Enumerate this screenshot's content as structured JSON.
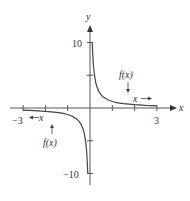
{
  "chart_data": {
    "type": "line",
    "title": "",
    "function": "f(x) = 1/x",
    "xlabel": "x",
    "ylabel": "y",
    "xlim": [
      -3,
      3
    ],
    "ylim": [
      -10,
      10
    ],
    "x_ticks": [
      -3,
      -2,
      -1,
      1,
      2,
      3
    ],
    "x_tick_labels": {
      "-3": "−3",
      "3": "3"
    },
    "y_ticks": [
      -10,
      -5,
      5,
      10
    ],
    "y_tick_labels": {
      "10": "10",
      "-10": "−10"
    },
    "grid": false,
    "legend": null,
    "series": [
      {
        "name": "f(x) right branch",
        "x": [
          0.1,
          0.12,
          0.15,
          0.2,
          0.25,
          0.3,
          0.4,
          0.5,
          0.6,
          0.8,
          1.0,
          1.25,
          1.5,
          2.0,
          2.5,
          3.0
        ],
        "y": [
          10,
          8.33,
          6.67,
          5,
          4,
          3.33,
          2.5,
          2,
          1.67,
          1.25,
          1,
          0.8,
          0.67,
          0.5,
          0.4,
          0.33
        ]
      },
      {
        "name": "f(x) left branch",
        "x": [
          -3.0,
          -2.5,
          -2.0,
          -1.5,
          -1.25,
          -1.0,
          -0.8,
          -0.6,
          -0.5,
          -0.4,
          -0.3,
          -0.25,
          -0.2,
          -0.15,
          -0.12,
          -0.1
        ],
        "y": [
          -0.33,
          -0.4,
          -0.5,
          -0.67,
          -0.8,
          -1,
          -1.25,
          -1.67,
          -2,
          -2.5,
          -3.33,
          -4,
          -5,
          -6.67,
          -8.33,
          -10
        ]
      }
    ],
    "annotations": [
      {
        "text": "f(x)",
        "position": "above right branch",
        "arrow": "down"
      },
      {
        "text": "x →",
        "position": "right branch near x-axis"
      },
      {
        "text": "← x",
        "position": "left of origin below x-axis"
      },
      {
        "text": "f(x)",
        "position": "below left branch",
        "arrow": "up"
      }
    ]
  },
  "labels": {
    "y_axis": "y",
    "x_axis": "x",
    "y_top": "10",
    "y_bottom": "−10",
    "x_left": "−3",
    "x_right": "3",
    "fx_right": "f(x)",
    "fx_left": "f(x)",
    "x_arrow_right": "x →",
    "x_arrow_left": "← x"
  }
}
